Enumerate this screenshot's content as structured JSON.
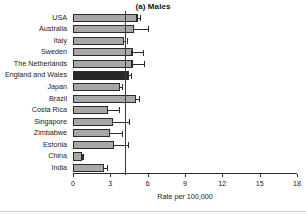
{
  "chart_data": {
    "type": "bar",
    "orientation": "horizontal",
    "title": "(a) Males",
    "xlabel": "Rate per 100,000",
    "ylabel": "",
    "xlim": [
      0,
      18
    ],
    "xticks": [
      0,
      3,
      6,
      9,
      12,
      15,
      18
    ],
    "grid": false,
    "legend": null,
    "reference_line": 4.2,
    "highlight_category": "England and Wales",
    "categories": [
      "USA",
      "Australia",
      "Italy",
      "Sweden",
      "The Netherlands",
      "England and Wales",
      "Japan",
      "Brazil",
      "Costa Rica",
      "Singapore",
      "Zimbabwe",
      "Estonia",
      "China",
      "India"
    ],
    "values": [
      5.2,
      4.9,
      4.1,
      4.8,
      4.8,
      4.5,
      3.8,
      5.1,
      2.8,
      3.2,
      3.0,
      3.3,
      0.7,
      2.5
    ],
    "error_low": [
      5.1,
      4.8,
      4.0,
      4.7,
      4.7,
      4.4,
      3.7,
      5.0,
      2.7,
      3.1,
      2.9,
      3.2,
      0.7,
      2.4
    ],
    "error_high": [
      5.4,
      6.0,
      4.3,
      5.6,
      5.7,
      4.7,
      3.9,
      5.3,
      3.7,
      4.5,
      3.9,
      4.4,
      0.8,
      2.7
    ],
    "bar_color": "#a8a8a8",
    "highlight_color": "#272727",
    "outline_color": "#2b2b2b"
  }
}
